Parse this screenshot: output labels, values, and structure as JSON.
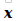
{
  "symbol": {
    "text": "x",
    "color": "#000000"
  },
  "decoration": {
    "shape": "partial-box-bottom",
    "color": "#c8c8c8"
  }
}
